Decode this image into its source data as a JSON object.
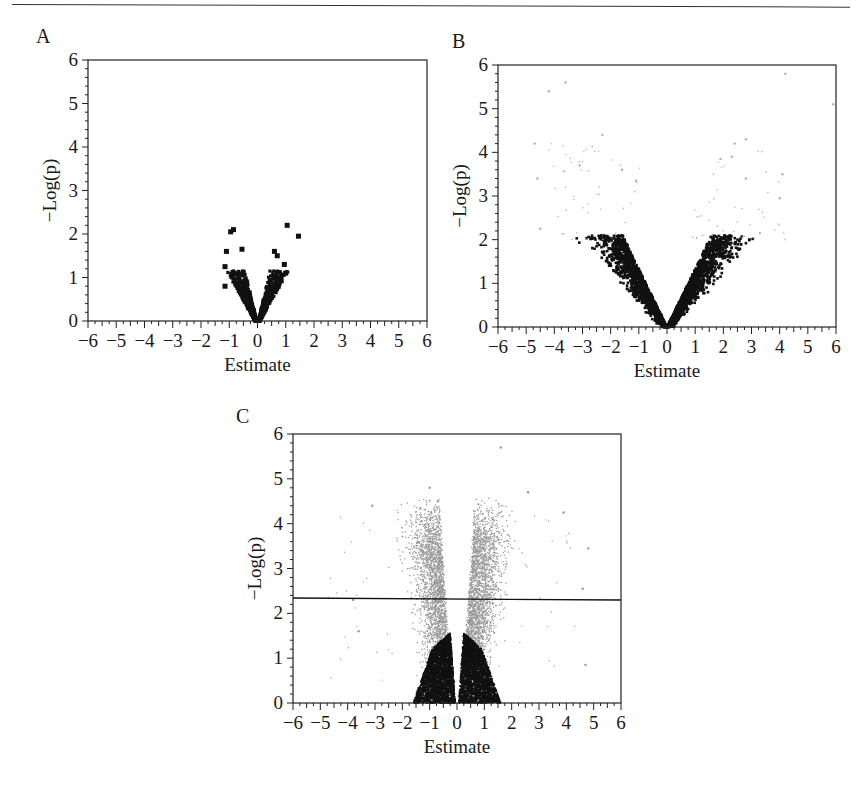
{
  "figure": {
    "panels": [
      {
        "id": "A",
        "label": "A",
        "label_pos": [
          36,
          25
        ]
      },
      {
        "id": "B",
        "label": "B",
        "label_pos": [
          452,
          30
        ]
      },
      {
        "id": "C",
        "label": "C",
        "label_pos": [
          236,
          405
        ]
      }
    ]
  },
  "chart_data": [
    {
      "panel": "A",
      "type": "scatter",
      "subtype": "volcano",
      "title": "",
      "xlabel": "Estimate",
      "ylabel": "−Log(p)",
      "xlim": [
        -6,
        6
      ],
      "ylim": [
        0,
        6
      ],
      "xticks": [
        -6,
        -5,
        -4,
        -3,
        -2,
        -1,
        0,
        1,
        2,
        3,
        4,
        5,
        6
      ],
      "yticks": [
        0,
        1,
        2,
        3,
        4,
        5,
        6
      ],
      "grid": false,
      "legend": null,
      "series": [
        {
          "name": "all features",
          "color": "#111111",
          "marker": "square",
          "description": "dense V-shaped cloud from x -1.2 to 1.0, y 0 to ~1.2",
          "notable_points": [
            [
              -0.95,
              2.05
            ],
            [
              -0.85,
              2.1
            ],
            [
              1.05,
              2.2
            ],
            [
              1.45,
              1.95
            ],
            [
              -1.1,
              1.6
            ],
            [
              -0.55,
              1.65
            ],
            [
              0.6,
              1.6
            ],
            [
              0.7,
              1.5
            ],
            [
              -1.15,
              1.25
            ],
            [
              0.95,
              1.3
            ],
            [
              -1.15,
              0.8
            ],
            [
              1.0,
              1.1
            ]
          ]
        }
      ],
      "plot_box_px": {
        "left": 88,
        "top": 60,
        "right": 427,
        "bottom": 321
      }
    },
    {
      "panel": "B",
      "type": "scatter",
      "subtype": "volcano",
      "title": "",
      "xlabel": "Estimate",
      "ylabel": "−Log(p)",
      "xlim": [
        -6,
        6
      ],
      "ylim": [
        0,
        6
      ],
      "xticks": [
        -6,
        -5,
        -4,
        -3,
        -2,
        -1,
        0,
        1,
        2,
        3,
        4,
        5,
        6
      ],
      "yticks": [
        0,
        1,
        2,
        3,
        4,
        5,
        6
      ],
      "grid": false,
      "legend": null,
      "series": [
        {
          "name": "non-significant",
          "color": "#111111",
          "marker": "square",
          "description": "dense V-shaped cloud x -3.1 to 3.6, y 0 to ~2.1"
        },
        {
          "name": "significant",
          "color": "#b0b0b0",
          "marker": "dot",
          "description": "sparse light gray points above y~2",
          "notable_points": [
            [
              -4.2,
              5.4
            ],
            [
              -3.6,
              5.6
            ],
            [
              -4.7,
              4.2
            ],
            [
              -2.3,
              4.4
            ],
            [
              -4.6,
              3.4
            ],
            [
              -3.1,
              3.7
            ],
            [
              -1.6,
              3.6
            ],
            [
              -1.1,
              3.35
            ],
            [
              2.4,
              4.2
            ],
            [
              2.8,
              4.3
            ],
            [
              1.9,
              3.85
            ],
            [
              2.3,
              3.9
            ],
            [
              4.1,
              3.5
            ],
            [
              4.0,
              2.95
            ],
            [
              4.2,
              5.8
            ],
            [
              5.9,
              5.1
            ],
            [
              2.8,
              3.4
            ],
            [
              -4.5,
              2.25
            ],
            [
              3.3,
              2.15
            ]
          ]
        }
      ],
      "plot_box_px": {
        "left": 498,
        "top": 65,
        "right": 836,
        "bottom": 327
      }
    },
    {
      "panel": "C",
      "type": "scatter",
      "subtype": "volcano",
      "title": "",
      "xlabel": "Estimate",
      "ylabel": "−Log(p)",
      "xlim": [
        -6,
        6
      ],
      "ylim": [
        0,
        6
      ],
      "xticks": [
        -6,
        -5,
        -4,
        -3,
        -2,
        -1,
        0,
        1,
        2,
        3,
        4,
        5,
        6
      ],
      "yticks": [
        0,
        1,
        2,
        3,
        4,
        5,
        6
      ],
      "grid": false,
      "legend": null,
      "annotations": [
        {
          "type": "hline",
          "y": 2.32,
          "color": "#111111",
          "description": "significance threshold"
        }
      ],
      "series": [
        {
          "name": "non-significant",
          "color": "#111111",
          "marker": "dot",
          "description": "dense black V-shaped cloud x -1.7 to 1.7, y 0 to ~1.7"
        },
        {
          "name": "flanking",
          "color": "#9a9a9a",
          "marker": "dot",
          "description": "dense gray cloud x -3 to 3.5, y 0.5 to ~4",
          "notable_points": [
            [
              -3.1,
              4.4
            ],
            [
              -1.0,
              4.8
            ],
            [
              -0.7,
              4.5
            ],
            [
              1.6,
              5.7
            ],
            [
              2.6,
              4.7
            ],
            [
              3.9,
              4.25
            ],
            [
              4.8,
              3.45
            ],
            [
              4.6,
              2.55
            ],
            [
              4.7,
              0.85
            ],
            [
              -3.8,
              2.3
            ],
            [
              -3.6,
              1.6
            ]
          ]
        }
      ],
      "plot_box_px": {
        "left": 293,
        "top": 434,
        "right": 621,
        "bottom": 703
      }
    }
  ]
}
